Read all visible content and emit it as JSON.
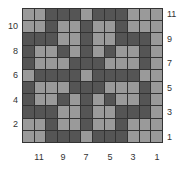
{
  "diagram": {
    "type": "weaving-draft-grid",
    "columns": 12,
    "rows": 11,
    "colors": {
      "light": "#9a9a9a",
      "dark": "#555555",
      "grid_line": "#333333"
    },
    "grid_rows_top_to_bottom": [
      "LLDDDLDDDLLL",
      "LLDLLDLLDLLL",
      "DDDLLDLLDDDL",
      "DLLDLDLDLLDL",
      "DLLLDDDLLLDL",
      "LDDDDLDDDDLL",
      "DLLLDDDLLLDL",
      "DLLDLDLDLLDL",
      "DDDLLDLLDDDL",
      "LLDLLDLLDLLL",
      "LLDDDLDDDLLL"
    ]
  },
  "axis_labels": {
    "left": [
      "10",
      "8",
      "6",
      "4",
      "2"
    ],
    "right": [
      "11",
      "9",
      "7",
      "5",
      "3",
      "1"
    ],
    "bottom": [
      "11",
      "9",
      "7",
      "5",
      "3",
      "1"
    ]
  }
}
